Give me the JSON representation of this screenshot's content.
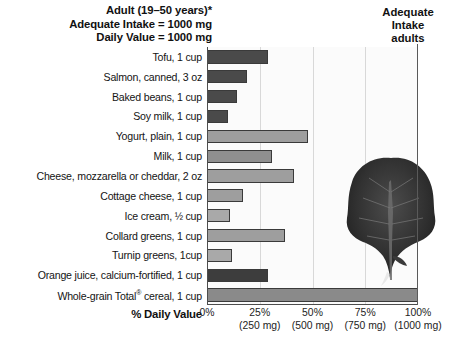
{
  "header": {
    "left_lines": [
      "Adult (19–50 years)*",
      "Adequate Intake = 1000 mg",
      "Daily Value = 1000 mg"
    ],
    "right_lines": [
      "Adequate",
      "Intake",
      "adults"
    ]
  },
  "axis": {
    "title_prefix": "% ",
    "title_main": "Daily Value",
    "ticks": [
      {
        "pct": "0%",
        "mg": ""
      },
      {
        "pct": "25%",
        "mg": "(250 mg)"
      },
      {
        "pct": "50%",
        "mg": "(500 mg)"
      },
      {
        "pct": "75%",
        "mg": "(750 mg)"
      },
      {
        "pct": "100%",
        "mg": "(1000 mg)"
      }
    ]
  },
  "image": {
    "greens_alt": "leafy-greens-photo"
  },
  "chart_data": {
    "type": "bar",
    "orientation": "horizontal",
    "xlabel": "% Daily Value",
    "ylabel": "",
    "xlim": [
      0,
      100
    ],
    "grid": true,
    "legend": "none",
    "xtick_values": [
      0,
      25,
      50,
      75,
      100
    ],
    "xtick_labels": [
      "0%",
      "25%",
      "50%",
      "75%",
      "100%"
    ],
    "xtick_sublabels": [
      "",
      "(250 mg)",
      "(500 mg)",
      "(750 mg)",
      "(1000 mg)"
    ],
    "categories": [
      "Tofu, 1 cup",
      "Salmon, canned, 3 oz",
      "Baked beans, 1 cup",
      "Soy milk, 1 cup",
      "Yogurt, plain, 1 cup",
      "Milk, 1 cup",
      "Cheese, mozzarella or cheddar, 2 oz",
      "Cottage cheese, 1 cup",
      "Ice cream, 1/2 cup",
      "Collard greens, 1 cup",
      "Turnip greens, 1cup",
      "Orange juice, calcium-fortified, 1 cup",
      "Whole-grain Total® cereal, 1 cup"
    ],
    "values": [
      29,
      19,
      14,
      10,
      48,
      31,
      41,
      17,
      11,
      37,
      12,
      29,
      100
    ],
    "bar_colors": [
      "#4a4a4a",
      "#4a4a4a",
      "#4a4a4a",
      "#4a4a4a",
      "#9e9e9e",
      "#8f8f8f",
      "#9e9e9e",
      "#9e9e9e",
      "#a9a9a9",
      "#9e9e9e",
      "#a9a9a9",
      "#3d3d3d",
      "#8a8a8a"
    ],
    "reference_line": {
      "label": "Adequate Intake adults",
      "value": 100
    }
  }
}
